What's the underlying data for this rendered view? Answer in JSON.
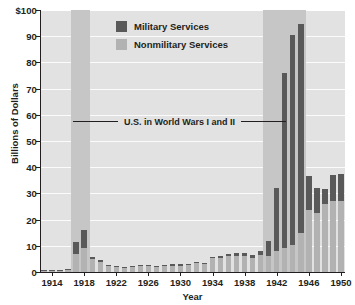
{
  "chart_data": {
    "type": "bar",
    "title": "",
    "xlabel": "Year",
    "ylabel": "Billions of Dollars",
    "ylim": [
      0,
      100
    ],
    "yticks": [
      0,
      10,
      20,
      30,
      40,
      50,
      60,
      70,
      80,
      90,
      100
    ],
    "ytick_labels": [
      "0",
      "10",
      "20",
      "30",
      "40",
      "50",
      "60",
      "70",
      "80",
      "90",
      "$100"
    ],
    "grid": true,
    "stacked": true,
    "legend_position": "upper-center",
    "legend": [
      "Military Services",
      "Nonmilitary Services"
    ],
    "colors": {
      "military": "#595959",
      "nonmilitary": "#b2b2b2",
      "plot_background": "#e2e2e2",
      "war_band": "#c6c6c6",
      "gridline": "#fbfbfb",
      "axis": "#231f20"
    },
    "categories": [
      1913,
      1914,
      1915,
      1916,
      1917,
      1918,
      1919,
      1920,
      1921,
      1922,
      1923,
      1924,
      1925,
      1926,
      1927,
      1928,
      1929,
      1930,
      1931,
      1932,
      1933,
      1934,
      1935,
      1936,
      1937,
      1938,
      1939,
      1940,
      1941,
      1942,
      1943,
      1944,
      1945,
      1946,
      1947,
      1948,
      1949,
      1950
    ],
    "xtick_labels": [
      "1914",
      "1918",
      "1922",
      "1926",
      "1930",
      "1934",
      "1938",
      "1942",
      "1946",
      "1950"
    ],
    "xticks": [
      1914,
      1918,
      1922,
      1926,
      1930,
      1934,
      1938,
      1942,
      1946,
      1950
    ],
    "series": [
      {
        "name": "Nonmilitary Services",
        "values": [
          0.5,
          0.6,
          0.5,
          0.6,
          7.0,
          9.0,
          5.0,
          4.0,
          2.3,
          1.8,
          1.7,
          1.9,
          2.3,
          2.2,
          1.8,
          2.4,
          2.4,
          2.4,
          2.7,
          3.4,
          3.1,
          5.2,
          5.3,
          6.0,
          6.3,
          6.2,
          5.4,
          6.4,
          6.0,
          8.2,
          9.3,
          10.5,
          15.0,
          23.5,
          22.5,
          26.0,
          27.0,
          27.0
        ]
      },
      {
        "name": "Military Services",
        "values": [
          0.3,
          0.3,
          0.3,
          0.4,
          4.5,
          7.0,
          0.6,
          0.5,
          0.3,
          0.5,
          0.4,
          0.4,
          0.4,
          0.4,
          0.4,
          0.4,
          0.5,
          0.5,
          0.5,
          0.5,
          0.4,
          0.6,
          0.9,
          0.8,
          0.8,
          1.0,
          1.1,
          1.5,
          5.8,
          24.0,
          66.5,
          80.0,
          79.5,
          13.0,
          9.5,
          5.5,
          10.0,
          10.5
        ]
      }
    ],
    "totals": [
      0.8,
      0.9,
      0.8,
      1.0,
      11.5,
      16.0,
      5.6,
      4.5,
      2.6,
      2.3,
      2.1,
      2.3,
      2.7,
      2.6,
      2.2,
      2.8,
      2.9,
      2.9,
      3.2,
      3.9,
      3.5,
      5.8,
      6.2,
      6.8,
      7.1,
      7.2,
      6.5,
      7.9,
      11.8,
      32.4,
      75.8,
      90.5,
      94.5,
      36.5,
      32.0,
      31.5,
      37.0,
      37.5
    ],
    "annotation": {
      "text": "U.S. in World Wars I and II",
      "y_value": 57
    },
    "war_bands": [
      {
        "label": "World War I",
        "start_year": 1917,
        "end_year": 1918
      },
      {
        "label": "World War II",
        "start_year": 1941,
        "end_year": 1945
      }
    ]
  }
}
